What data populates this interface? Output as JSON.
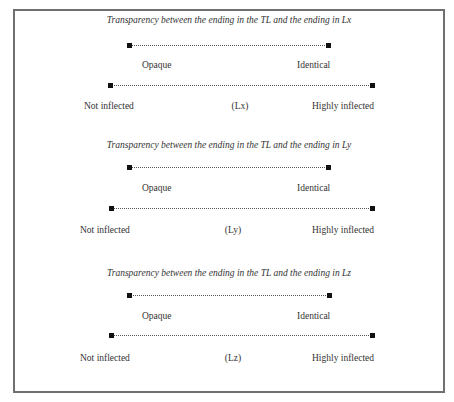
{
  "frame": {
    "border_color": "#707070"
  },
  "sections": [
    {
      "title": "Transparency between the ending in the TL and the ending in Lx",
      "transparency_scale": {
        "left_label": "Opaque",
        "right_label": "Identical"
      },
      "inflection_scale": {
        "left_label": "Not inflected",
        "center_label": "(Lx)",
        "right_label": "Highly inflected"
      }
    },
    {
      "title": "Transparency between the ending in the TL and the ending in Ly",
      "transparency_scale": {
        "left_label": "Opaque",
        "right_label": "Identical"
      },
      "inflection_scale": {
        "left_label": "Not inflected",
        "center_label": "(Ly)",
        "right_label": "Highly inflected"
      }
    },
    {
      "title": "Transparency between the ending in the TL and the ending in Lz",
      "transparency_scale": {
        "left_label": "Opaque",
        "right_label": "Identical"
      },
      "inflection_scale": {
        "left_label": "Not inflected",
        "center_label": "(Lz)",
        "right_label": "Highly inflected"
      }
    }
  ]
}
